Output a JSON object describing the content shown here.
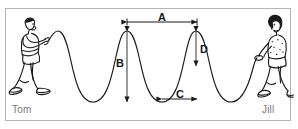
{
  "figure": {
    "border_color": "#b6b6b6",
    "background_color": "#ffffff",
    "stroke_color": "#1a1a1a"
  },
  "people": [
    {
      "id": "tom",
      "label": "Tom",
      "side": "left",
      "label_color": "#7b7b7b",
      "description": "boy walking left holding rope end in raised hand"
    },
    {
      "id": "jill",
      "label": "Jill",
      "side": "right",
      "label_color": "#7b7b7b",
      "description": "girl walking right holding rope end at waist"
    }
  ],
  "measurements": [
    {
      "id": "A",
      "label": "A",
      "orientation": "horizontal",
      "arrow": "double",
      "meaning": "crest-to-crest distance (wavelength)",
      "x1": 127,
      "x2": 197,
      "y": 22
    },
    {
      "id": "B",
      "label": "B",
      "orientation": "vertical",
      "arrow": "double",
      "meaning": "crest-to-trough height (peak-to-peak)",
      "x": 127,
      "y1": 31,
      "y2": 102
    },
    {
      "id": "C",
      "label": "C",
      "orientation": "horizontal",
      "arrow": "double",
      "meaning": "trough-to-crest horizontal distance (half wavelength)",
      "x1": 162,
      "x2": 197,
      "y": 99
    },
    {
      "id": "D",
      "label": "D",
      "orientation": "vertical",
      "arrow": "double",
      "meaning": "amplitude (crest to rest axis)",
      "x": 196,
      "y1": 31,
      "y2": 66
    }
  ],
  "wave": {
    "type": "transverse",
    "crests_x": [
      58,
      127,
      196
    ],
    "troughs_x": [
      93,
      162,
      231
    ],
    "crest_y": 31,
    "trough_y": 102,
    "midline_y": 66,
    "start_x": 48,
    "end_x": 252,
    "stroke_color": "#1a1a1a",
    "stroke_width": 1.1
  }
}
